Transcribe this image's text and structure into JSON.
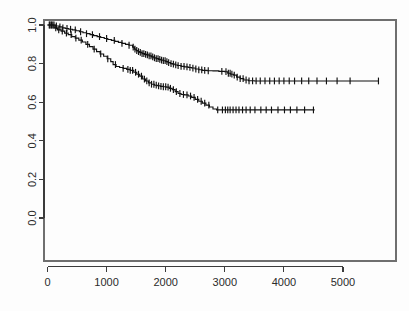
{
  "figure": {
    "title": "",
    "background_color": "#ffffff",
    "curve_color": "#111111",
    "axis_color": "#3b3b3b",
    "frame_color": "#6f6f6f"
  },
  "chart_data": {
    "type": "line",
    "chart_kind": "kaplan-meier-survival",
    "title": "",
    "subtitle": "",
    "xlabel": "",
    "ylabel": "",
    "xlim": [
      -120,
      5800
    ],
    "ylim": [
      -0.04,
      1.04
    ],
    "grid": false,
    "legend": false,
    "legend_position": "none",
    "xticks": [
      0,
      1000,
      2000,
      3000,
      4000,
      5000
    ],
    "xticklabels": [
      "0",
      "1000",
      "2000",
      "3000",
      "4000",
      "5000"
    ],
    "yticks": [
      0.0,
      0.2,
      0.4,
      0.6,
      0.8,
      1.0
    ],
    "yticklabels": [
      "0.0",
      "0.2",
      "0.4",
      "0.6",
      "0.8",
      "1.0"
    ],
    "y_tick_label_rotation": 90,
    "annotations": [],
    "series": [
      {
        "name": "upper-curve",
        "plateau_value": 0.71,
        "max_time": 5600,
        "steps": [
          [
            0,
            1.0
          ],
          [
            60,
            1.0
          ],
          [
            130,
            0.995
          ],
          [
            200,
            0.99
          ],
          [
            250,
            0.985
          ],
          [
            300,
            0.982
          ],
          [
            360,
            0.978
          ],
          [
            420,
            0.975
          ],
          [
            480,
            0.97
          ],
          [
            540,
            0.965
          ],
          [
            600,
            0.96
          ],
          [
            660,
            0.955
          ],
          [
            720,
            0.95
          ],
          [
            780,
            0.945
          ],
          [
            840,
            0.94
          ],
          [
            900,
            0.935
          ],
          [
            960,
            0.93
          ],
          [
            1020,
            0.925
          ],
          [
            1080,
            0.92
          ],
          [
            1140,
            0.915
          ],
          [
            1200,
            0.91
          ],
          [
            1260,
            0.905
          ],
          [
            1320,
            0.9
          ],
          [
            1380,
            0.895
          ],
          [
            1440,
            0.885
          ],
          [
            1470,
            0.875
          ],
          [
            1500,
            0.868
          ],
          [
            1530,
            0.862
          ],
          [
            1560,
            0.858
          ],
          [
            1600,
            0.852
          ],
          [
            1640,
            0.848
          ],
          [
            1680,
            0.845
          ],
          [
            1720,
            0.84
          ],
          [
            1760,
            0.835
          ],
          [
            1800,
            0.83
          ],
          [
            1840,
            0.826
          ],
          [
            1880,
            0.822
          ],
          [
            1920,
            0.818
          ],
          [
            1960,
            0.815
          ],
          [
            2000,
            0.81
          ],
          [
            2040,
            0.805
          ],
          [
            2080,
            0.8
          ],
          [
            2120,
            0.797
          ],
          [
            2160,
            0.793
          ],
          [
            2200,
            0.79
          ],
          [
            2260,
            0.786
          ],
          [
            2320,
            0.783
          ],
          [
            2380,
            0.78
          ],
          [
            2440,
            0.777
          ],
          [
            2500,
            0.772
          ],
          [
            2560,
            0.768
          ],
          [
            2620,
            0.765
          ],
          [
            2700,
            0.763
          ],
          [
            2800,
            0.762
          ],
          [
            2900,
            0.76
          ],
          [
            3000,
            0.758
          ],
          [
            3050,
            0.75
          ],
          [
            3100,
            0.745
          ],
          [
            3150,
            0.74
          ],
          [
            3200,
            0.73
          ],
          [
            3260,
            0.722
          ],
          [
            3320,
            0.715
          ],
          [
            3400,
            0.711
          ],
          [
            3500,
            0.71
          ],
          [
            5600,
            0.71
          ]
        ],
        "censor_times": [
          40,
          70,
          110,
          150,
          210,
          260,
          330,
          390,
          470,
          560,
          660,
          760,
          880,
          1000,
          1130,
          1260,
          1380,
          1450,
          1480,
          1510,
          1540,
          1570,
          1600,
          1630,
          1660,
          1690,
          1720,
          1750,
          1780,
          1810,
          1840,
          1870,
          1900,
          1930,
          1960,
          1990,
          2020,
          2050,
          2090,
          2130,
          2170,
          2210,
          2260,
          2310,
          2360,
          2410,
          2460,
          2510,
          2560,
          2610,
          2660,
          2720,
          2950,
          3020,
          3060,
          3090,
          3120,
          3160,
          3210,
          3260,
          3310,
          3360,
          3410,
          3470,
          3530,
          3600,
          3680,
          3760,
          3840,
          3920,
          4000,
          4090,
          4180,
          4300,
          4420,
          4560,
          4720,
          4900,
          5120,
          5600
        ]
      },
      {
        "name": "lower-curve",
        "plateau_value": 0.56,
        "max_time": 4520,
        "steps": [
          [
            0,
            1.0
          ],
          [
            50,
            1.0
          ],
          [
            110,
            0.985
          ],
          [
            170,
            0.975
          ],
          [
            230,
            0.968
          ],
          [
            290,
            0.958
          ],
          [
            350,
            0.95
          ],
          [
            410,
            0.94
          ],
          [
            470,
            0.932
          ],
          [
            530,
            0.922
          ],
          [
            590,
            0.912
          ],
          [
            650,
            0.9
          ],
          [
            710,
            0.888
          ],
          [
            770,
            0.875
          ],
          [
            830,
            0.862
          ],
          [
            890,
            0.85
          ],
          [
            950,
            0.838
          ],
          [
            1010,
            0.825
          ],
          [
            1070,
            0.81
          ],
          [
            1110,
            0.795
          ],
          [
            1160,
            0.785
          ],
          [
            1220,
            0.78
          ],
          [
            1280,
            0.775
          ],
          [
            1340,
            0.77
          ],
          [
            1400,
            0.765
          ],
          [
            1460,
            0.755
          ],
          [
            1510,
            0.745
          ],
          [
            1560,
            0.735
          ],
          [
            1610,
            0.72
          ],
          [
            1660,
            0.71
          ],
          [
            1710,
            0.7
          ],
          [
            1760,
            0.693
          ],
          [
            1810,
            0.688
          ],
          [
            1860,
            0.685
          ],
          [
            1910,
            0.682
          ],
          [
            1960,
            0.68
          ],
          [
            2010,
            0.678
          ],
          [
            2060,
            0.672
          ],
          [
            2110,
            0.665
          ],
          [
            2160,
            0.655
          ],
          [
            2210,
            0.645
          ],
          [
            2260,
            0.64
          ],
          [
            2320,
            0.638
          ],
          [
            2380,
            0.632
          ],
          [
            2440,
            0.625
          ],
          [
            2500,
            0.615
          ],
          [
            2560,
            0.605
          ],
          [
            2620,
            0.595
          ],
          [
            2680,
            0.585
          ],
          [
            2740,
            0.575
          ],
          [
            2800,
            0.565
          ],
          [
            2860,
            0.56
          ],
          [
            2950,
            0.56
          ],
          [
            4520,
            0.56
          ]
        ],
        "censor_times": [
          30,
          60,
          90,
          140,
          190,
          250,
          320,
          400,
          480,
          570,
          680,
          790,
          900,
          1020,
          1150,
          1280,
          1360,
          1400,
          1440,
          1490,
          1540,
          1590,
          1640,
          1680,
          1720,
          1760,
          1800,
          1840,
          1880,
          1920,
          1960,
          2000,
          2040,
          2080,
          2130,
          2180,
          2240,
          2300,
          2360,
          2420,
          2480,
          2540,
          2600,
          2660,
          2730,
          2880,
          2960,
          3010,
          3050,
          3090,
          3140,
          3190,
          3240,
          3300,
          3360,
          3430,
          3510,
          3610,
          3700,
          3790,
          3900,
          4010,
          4110,
          4220,
          4350,
          4500
        ]
      }
    ]
  },
  "axes": {
    "x_axis_name": "time-axis",
    "y_axis_name": "survival-probability-axis"
  }
}
